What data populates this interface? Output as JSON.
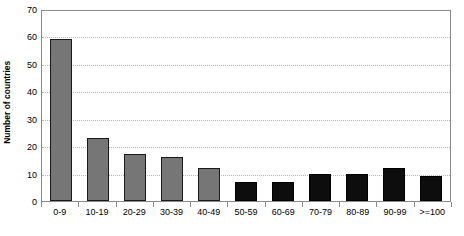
{
  "chart_data": {
    "type": "bar",
    "title": "",
    "subtitle": "",
    "xlabel": "",
    "ylabel": "Number of countries",
    "categories": [
      "0-9",
      "10-19",
      "20-29",
      "30-39",
      "40-49",
      "50-59",
      "60-69",
      "70-79",
      "80-89",
      "90-99",
      ">=100"
    ],
    "values": [
      59,
      23,
      17,
      16,
      12,
      7,
      7,
      10,
      10,
      12,
      9
    ],
    "bar_colors": [
      "gray",
      "gray",
      "gray",
      "gray",
      "gray",
      "black",
      "black",
      "black",
      "black",
      "black",
      "black"
    ],
    "ylim": [
      0,
      70
    ],
    "ytick_values": [
      0,
      10,
      20,
      30,
      40,
      50,
      60,
      70
    ],
    "ytick_labels": [
      "0",
      "10",
      "20",
      "30",
      "40",
      "50",
      "60",
      "70"
    ],
    "grid": true,
    "grid_axis": "y",
    "legend": false,
    "legend_position": "none",
    "colors": {
      "series_gray": "#767676",
      "series_black": "#0d0d0d",
      "bar_border": "#1a1a1a",
      "gridline": "#b9b9b9",
      "axis": "#8a8a8a",
      "background": "#ffffff",
      "text": "#000000"
    }
  }
}
